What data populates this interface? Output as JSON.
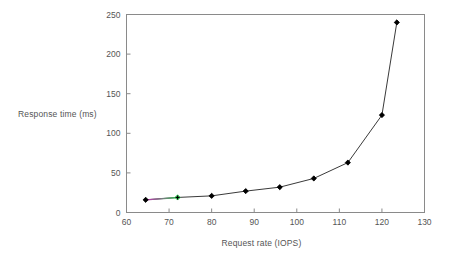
{
  "chart_data": {
    "type": "line",
    "title": "",
    "xlabel": "Request rate (IOPS)",
    "ylabel": "Response time (ms)",
    "xlim": [
      60,
      130
    ],
    "ylim": [
      0,
      250
    ],
    "xticks": [
      60,
      70,
      80,
      90,
      100,
      110,
      120,
      130
    ],
    "yticks": [
      0,
      50,
      100,
      150,
      200,
      250
    ],
    "xtick_labels": [
      "60",
      "70",
      "80",
      "90",
      "100",
      "110",
      "120",
      "130"
    ],
    "ytick_labels": [
      "0",
      "50",
      "100",
      "150",
      "200",
      "250"
    ],
    "grid": false,
    "legend": null,
    "series": [
      {
        "name": "response-time",
        "marker": "diamond",
        "marker_color": "#000000",
        "line_color": "#3a3a3a",
        "x": [
          64.5,
          72,
          80,
          88,
          96,
          104,
          112,
          120,
          123.5
        ],
        "values": [
          16,
          19,
          21,
          27,
          32,
          43,
          63,
          123,
          240
        ]
      }
    ],
    "annotations": [
      {
        "name": "magenta-green-segment",
        "description": "colored line segment between first and second data points",
        "from_x": 64.5,
        "to_x": 72,
        "colors": [
          "#c030b0",
          "#30c050"
        ]
      }
    ]
  },
  "axes": {
    "frame_color": "#8a8a8a",
    "tick_color": "#8a8a8a",
    "background": "#ffffff"
  }
}
